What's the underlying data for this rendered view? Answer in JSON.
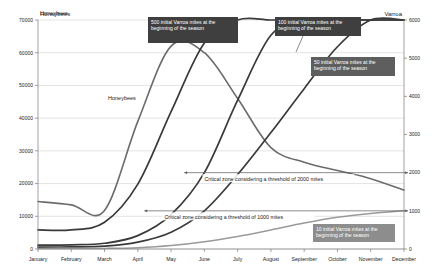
{
  "chart_data": {
    "type": "line",
    "title": "",
    "x": [
      "January",
      "February",
      "March",
      "April",
      "May",
      "June",
      "July",
      "August",
      "September",
      "October",
      "November",
      "December"
    ],
    "xlabel": "",
    "axes": {
      "left": {
        "label": "Honeybees",
        "min": 0,
        "max": 70000,
        "step": 10000,
        "ticks": [
          "0",
          "10000",
          "20000",
          "30000",
          "40000",
          "50000",
          "60000",
          "70000"
        ]
      },
      "right": {
        "label": "Varroa",
        "min": 0,
        "max": 6000,
        "step": 1000,
        "ticks": [
          "0",
          "1000",
          "2000",
          "3000",
          "4000",
          "5000",
          "6000"
        ]
      }
    },
    "grid": true,
    "legend_position": "inline-annotations",
    "series": [
      {
        "name": "Honeybees",
        "axis": "left",
        "color": "#6b6b6b",
        "width": 1.6,
        "values": [
          14500,
          13500,
          11800,
          39000,
          62000,
          60000,
          46000,
          31000,
          26500,
          24000,
          21500,
          18000
        ]
      },
      {
        "name": "500 initial Varroa mites at the beginning of the season",
        "axis": "right",
        "color": "#3a3a3a",
        "width": 1.7,
        "values": [
          500,
          500,
          700,
          1700,
          3600,
          5400,
          6000,
          6000,
          6000,
          6000,
          6000,
          6000
        ]
      },
      {
        "name": "100 initial Varroa mites at the beginning of the season",
        "axis": "right",
        "color": "#3a3a3a",
        "width": 1.7,
        "values": [
          100,
          110,
          150,
          350,
          900,
          2000,
          3900,
          5600,
          6000,
          6000,
          6000,
          6000
        ]
      },
      {
        "name": "50 initial Varroa mites at the beginning of the season",
        "axis": "right",
        "color": "#3a3a3a",
        "width": 1.7,
        "values": [
          50,
          55,
          75,
          180,
          440,
          1000,
          1950,
          3050,
          4200,
          5300,
          6000,
          6000
        ]
      },
      {
        "name": "10 initial Varroa mites at the beginning of the season",
        "axis": "right",
        "color": "#9a9a9a",
        "width": 1.5,
        "values": [
          10,
          12,
          16,
          35,
          90,
          190,
          330,
          500,
          680,
          830,
          930,
          1000
        ]
      }
    ],
    "threshold_lines": [
      {
        "name": "Critical zone considering a threshold of 2000 mites",
        "value": 2000,
        "axis": "right",
        "label": "Critical zone considering a threshold of 2000 mites",
        "start_month_index": 4.4,
        "arrow": "both"
      },
      {
        "name": "Critical zone considering a threshold of 1000 mites",
        "value": 1000,
        "axis": "right",
        "label": "Critical zone considering a threshold of 1000 mites",
        "start_month_index": 3.2,
        "arrow": "both"
      }
    ],
    "annotations": [
      {
        "id": "label-honeybees-top",
        "text": "Honeybees",
        "x": 40,
        "y": 15,
        "style": "plain"
      },
      {
        "id": "label-honeybees-inline",
        "text": "Honeybees",
        "x": 108,
        "y": 100,
        "style": "plain"
      },
      {
        "id": "callout-500",
        "text": "500 initial Varroa mites at the beginning of the season",
        "box": {
          "x": 148,
          "y": 17,
          "w": 90,
          "h": 26
        },
        "fill": "#3f3f3f",
        "text_color": "#ffffff"
      },
      {
        "id": "callout-100",
        "text": "100 initial Varroa mites at the beginning of the season",
        "box": {
          "x": 275,
          "y": 17,
          "w": 86,
          "h": 19
        },
        "fill": "#3f3f3f",
        "text_color": "#ffffff",
        "leader": {
          "x1": 303,
          "y1": 36,
          "x2": 296,
          "y2": 52
        }
      },
      {
        "id": "callout-50",
        "text": "50 initial Varroa mites at the beginning of the season",
        "box": {
          "x": 311,
          "y": 57,
          "w": 84,
          "h": 19
        },
        "fill": "#5e5e5e",
        "text_color": "#ffffff"
      },
      {
        "id": "callout-10",
        "text": "10 initial Varroa mites at the beginning of the season",
        "box": {
          "x": 313,
          "y": 224,
          "w": 82,
          "h": 18
        },
        "fill": "#8d8d8d",
        "text_color": "#ffffff"
      }
    ],
    "colors": {
      "honeybee_line": "#6b6b6b",
      "varroa_line": "#3a3a3a",
      "varroa_light_line": "#9a9a9a",
      "gridline": "#c8c8c8",
      "axis": "#7a7a7a",
      "callout_dark": "#3f3f3f",
      "callout_mid": "#5e5e5e",
      "callout_light": "#8d8d8d",
      "text": "#1a1a1a",
      "background": "#ffffff"
    }
  }
}
